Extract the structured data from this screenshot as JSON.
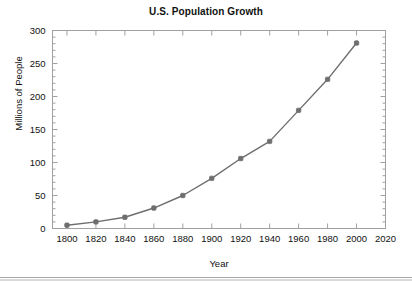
{
  "chart_data": {
    "type": "line",
    "title": "U.S. Population Growth",
    "xlabel": "Year",
    "ylabel": "Millions of People",
    "x": [
      1800,
      1820,
      1840,
      1860,
      1880,
      1900,
      1920,
      1940,
      1960,
      1980,
      2000
    ],
    "values": [
      5,
      10,
      17,
      31,
      50,
      76,
      106,
      132,
      179,
      226,
      281
    ],
    "series": [
      {
        "name": "U.S. Population",
        "values": [
          5,
          10,
          17,
          31,
          50,
          76,
          106,
          132,
          179,
          226,
          281
        ]
      }
    ],
    "xlim": [
      1790,
      2020
    ],
    "ylim": [
      0,
      300
    ],
    "xticks": [
      1800,
      1820,
      1840,
      1860,
      1880,
      1900,
      1920,
      1940,
      1960,
      1980,
      2000,
      2020
    ],
    "xtick_labels": [
      "1800",
      "1820",
      "1840",
      "1860",
      "1880",
      "1900",
      "1920",
      "1940",
      "1960",
      "1980",
      "2000",
      "2020"
    ],
    "yticks": [
      0,
      50,
      100,
      150,
      200,
      250,
      300
    ],
    "ytick_labels": [
      "0",
      "50",
      "100",
      "150",
      "200",
      "250",
      "300"
    ],
    "y_minor_step": 10,
    "grid": false,
    "legend": "none",
    "marker": "square-filled",
    "line_color": "#6e6e6e",
    "marker_color": "#6e6e6e",
    "axis_color": "#a0a0a0",
    "text_color": "#111111",
    "background": "#ffffff"
  }
}
